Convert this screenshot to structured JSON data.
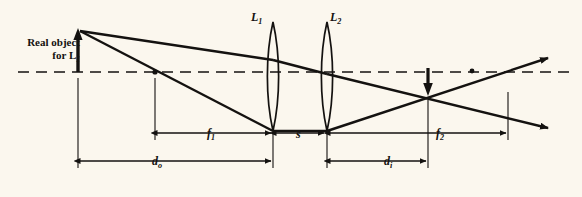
{
  "figure": {
    "type": "optics-ray-diagram",
    "background_color": "#fbf7ee",
    "ink_color": "#141210"
  },
  "labels": {
    "object_line1": "Real object",
    "object_line2_prefix": "for ",
    "object_line2_symbol": "L",
    "object_line2_sub": "1",
    "lens1": "L",
    "lens1_sub": "1",
    "lens2": "L",
    "lens2_sub": "2",
    "f1": "f",
    "f1_sub": "1",
    "s": "s",
    "f2": "f",
    "f2_sub": "2",
    "do": "d",
    "do_sub": "o",
    "di": "d",
    "di_sub": "i"
  },
  "geometry": {
    "optical_axis_y": 72,
    "object": {
      "x": 78,
      "tip_y": 32,
      "base_y": 72
    },
    "focal_point_f1": {
      "x": 155,
      "y": 72
    },
    "lens1": {
      "x": 273,
      "top_y": 22,
      "bottom_y": 131
    },
    "lens2": {
      "x": 327,
      "top_y": 22,
      "bottom_y": 131
    },
    "image": {
      "x": 428,
      "tip_y": 92,
      "base_y": 70
    },
    "f2_right_end": {
      "x": 508
    },
    "ray_exit_right": {
      "x": 548
    }
  },
  "dimensions": [
    {
      "name": "f1",
      "label": "f₁",
      "from_x": 155,
      "to_x": 273,
      "y": 133
    },
    {
      "name": "s",
      "label": "s",
      "from_x": 273,
      "to_x": 327,
      "y": 133
    },
    {
      "name": "f2",
      "label": "f₂",
      "from_x": 327,
      "to_x": 508,
      "y": 133
    },
    {
      "name": "do",
      "label": "d₀",
      "from_x": 78,
      "to_x": 273,
      "y": 161
    },
    {
      "name": "di",
      "label": "dᵢ",
      "from_x": 327,
      "to_x": 428,
      "y": 161
    }
  ]
}
